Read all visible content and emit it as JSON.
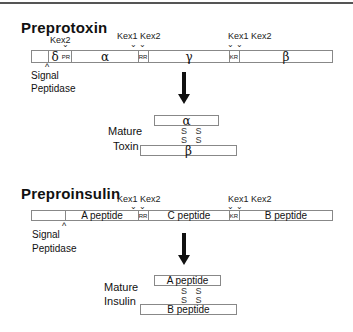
{
  "toxin": {
    "title": "Preprotoxin",
    "kex_labels": {
      "kex2_a": "Kex2",
      "kex1_b": "Kex1",
      "kex2_b": "Kex2",
      "kex1_c": "Kex1",
      "kex2_c": "Kex2"
    },
    "segments": {
      "delta": "δ",
      "pr": "PR",
      "alpha": "α",
      "rr": "RR",
      "gamma": "γ",
      "kr": "KR",
      "beta": "β"
    },
    "signal_label_1": "Signal",
    "signal_label_2": "Peptidase",
    "mature_label_1": "Mature",
    "mature_label_2": "Toxin",
    "mature_top": "α",
    "mature_bottom": "β",
    "ss_1": "S S",
    "ss_2": "S S"
  },
  "insulin": {
    "title": "Preproinsulin",
    "kex_labels": {
      "kex1_b": "Kex1",
      "kex2_b": "Kex2",
      "kex1_c": "Kex1",
      "kex2_c": "Kex2"
    },
    "segments": {
      "a": "A peptide",
      "rr": "RR",
      "c": "C peptide",
      "kr": "KR",
      "b": "B peptide"
    },
    "signal_label_1": "Signal",
    "signal_label_2": "Peptidase",
    "mature_label_1": "Mature",
    "mature_label_2": "Insulin",
    "mature_top": "A peptide",
    "mature_bottom": "B peptide",
    "ss_1": "S S",
    "ss_2": "S S"
  },
  "arrow_glyph": "⌄",
  "up_arrow_glyph": "^"
}
